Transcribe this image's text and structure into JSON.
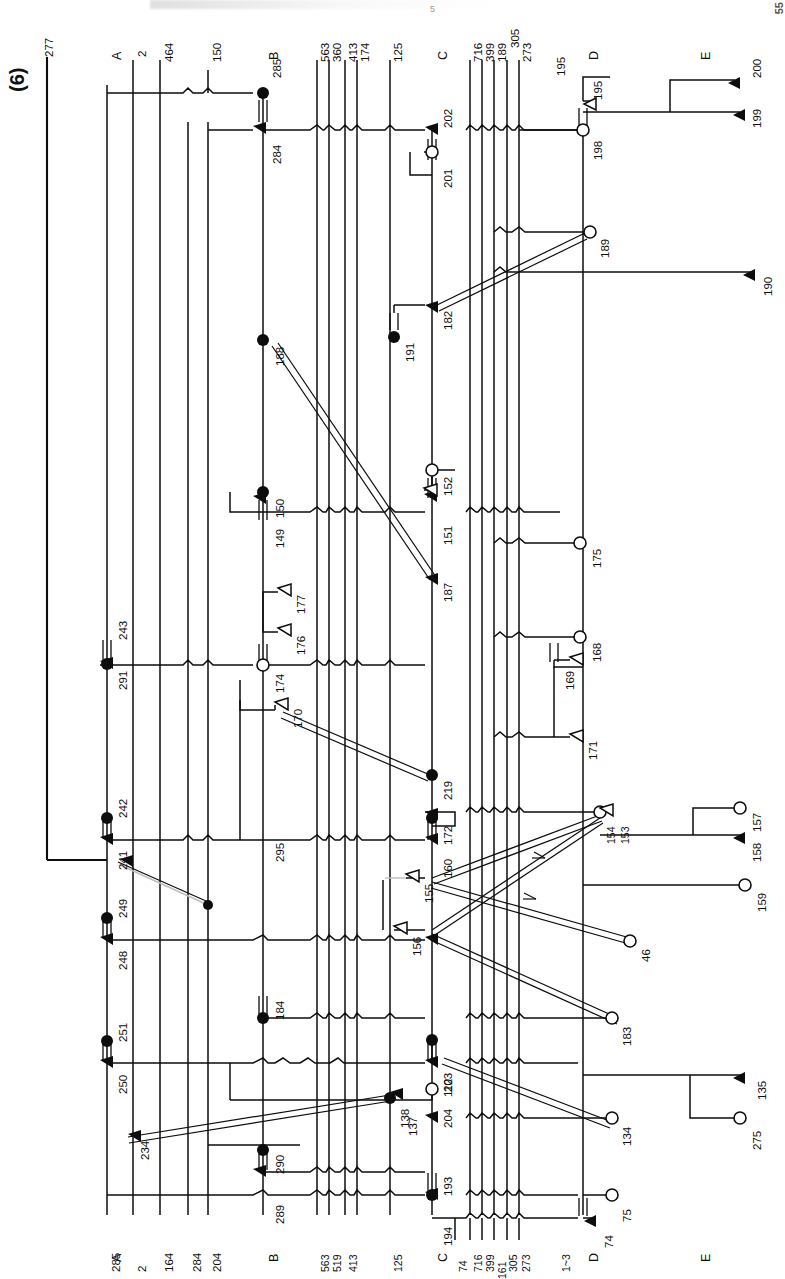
{
  "figure": {
    "number": "(6)",
    "page_number": "55",
    "header_ghost": "5"
  },
  "sections": [
    {
      "id": "A_top",
      "label": "A"
    },
    {
      "id": "B_top",
      "label": "B"
    },
    {
      "id": "C_top",
      "label": "C"
    },
    {
      "id": "D_top",
      "label": "D"
    },
    {
      "id": "E_top",
      "label": "E"
    },
    {
      "id": "A_bot",
      "label": "A"
    },
    {
      "id": "B_bot",
      "label": "B"
    },
    {
      "id": "C_bot",
      "label": "C"
    },
    {
      "id": "D_bot",
      "label": "D"
    },
    {
      "id": "E_bot",
      "label": "E"
    }
  ],
  "bus_labels_top": [
    {
      "id": "t277",
      "text": "277"
    },
    {
      "id": "t2",
      "text": "2"
    },
    {
      "id": "t464",
      "text": "464"
    },
    {
      "id": "t150",
      "text": "150"
    },
    {
      "id": "t563",
      "text": "563"
    },
    {
      "id": "t360",
      "text": "360"
    },
    {
      "id": "t413",
      "text": "413"
    },
    {
      "id": "t174",
      "text": "174"
    },
    {
      "id": "t125",
      "text": "125"
    },
    {
      "id": "t716",
      "text": "716"
    },
    {
      "id": "t399",
      "text": "399"
    },
    {
      "id": "t189",
      "text": "189"
    },
    {
      "id": "t305",
      "text": "305"
    },
    {
      "id": "t273",
      "text": "273"
    },
    {
      "id": "t195",
      "text": "195"
    }
  ],
  "bus_labels_bottom": [
    {
      "id": "b285",
      "text": "285"
    },
    {
      "id": "b2",
      "text": "2"
    },
    {
      "id": "b164",
      "text": "164"
    },
    {
      "id": "b284",
      "text": "284"
    },
    {
      "id": "b204",
      "text": "204"
    },
    {
      "id": "b563",
      "text": "563"
    },
    {
      "id": "b519",
      "text": "519"
    },
    {
      "id": "b413",
      "text": "413"
    },
    {
      "id": "b125",
      "text": "125"
    },
    {
      "id": "b74",
      "text": "74"
    },
    {
      "id": "b716",
      "text": "716"
    },
    {
      "id": "b399",
      "text": "399"
    },
    {
      "id": "b305",
      "text": "305"
    },
    {
      "id": "b273",
      "text": "273"
    },
    {
      "id": "b161",
      "text": "161"
    },
    {
      "id": "b1_3",
      "text": "1~3"
    }
  ],
  "terminals": [
    {
      "id": "n277",
      "text": "277",
      "kind": "line-end"
    },
    {
      "id": "n285",
      "text": "285",
      "kind": "solid"
    },
    {
      "id": "n284",
      "text": "284",
      "kind": "triangle"
    },
    {
      "id": "n202",
      "text": "202",
      "kind": "triangle"
    },
    {
      "id": "n201",
      "text": "201",
      "kind": "open"
    },
    {
      "id": "n195b",
      "text": "195",
      "kind": "triangle"
    },
    {
      "id": "n198",
      "text": "198",
      "kind": "open"
    },
    {
      "id": "n200",
      "text": "200",
      "kind": "triangle"
    },
    {
      "id": "n199",
      "text": "199",
      "kind": "triangle"
    },
    {
      "id": "n189",
      "text": "189",
      "kind": "open"
    },
    {
      "id": "n190",
      "text": "190",
      "kind": "triangle"
    },
    {
      "id": "n182",
      "text": "182",
      "kind": "triangle"
    },
    {
      "id": "n191",
      "text": "191",
      "kind": "solid"
    },
    {
      "id": "n188",
      "text": "188",
      "kind": "solid"
    },
    {
      "id": "n187",
      "text": "187",
      "kind": "triangle"
    },
    {
      "id": "n150",
      "text": "150",
      "kind": "solid"
    },
    {
      "id": "n149",
      "text": "149",
      "kind": "triangle"
    },
    {
      "id": "n152",
      "text": "152",
      "kind": "open"
    },
    {
      "id": "n151",
      "text": "151",
      "kind": "triangle"
    },
    {
      "id": "n175",
      "text": "175",
      "kind": "open"
    },
    {
      "id": "n177",
      "text": "177",
      "kind": "triangle"
    },
    {
      "id": "n176",
      "text": "176",
      "kind": "triangle"
    },
    {
      "id": "n174",
      "text": "174",
      "kind": "open"
    },
    {
      "id": "n170",
      "text": "170",
      "kind": "triangle"
    },
    {
      "id": "n168",
      "text": "168",
      "kind": "open"
    },
    {
      "id": "n169",
      "text": "169",
      "kind": "triangle"
    },
    {
      "id": "n171",
      "text": "171",
      "kind": "triangle"
    },
    {
      "id": "n243",
      "text": "243",
      "kind": "triangle"
    },
    {
      "id": "n291",
      "text": "291",
      "kind": "solid"
    },
    {
      "id": "n242",
      "text": "242",
      "kind": "solid"
    },
    {
      "id": "n241",
      "text": "241",
      "kind": "triangle"
    },
    {
      "id": "n295",
      "text": "295",
      "kind": "triangle"
    },
    {
      "id": "n219",
      "text": "219",
      "kind": "solid"
    },
    {
      "id": "n172",
      "text": "172",
      "kind": "solid"
    },
    {
      "id": "n160",
      "text": "160",
      "kind": "triangle"
    },
    {
      "id": "n153",
      "text": "153",
      "kind": "triangle"
    },
    {
      "id": "n154",
      "text": "154",
      "kind": "open"
    },
    {
      "id": "n157",
      "text": "157",
      "kind": "open"
    },
    {
      "id": "n158",
      "text": "158",
      "kind": "triangle"
    },
    {
      "id": "n159",
      "text": "159",
      "kind": "open"
    },
    {
      "id": "n155",
      "text": "155",
      "kind": "triangle"
    },
    {
      "id": "n156",
      "text": "156",
      "kind": "triangle"
    },
    {
      "id": "n46",
      "text": "46",
      "kind": "open"
    },
    {
      "id": "n249",
      "text": "249",
      "kind": "solid"
    },
    {
      "id": "n248",
      "text": "248",
      "kind": "triangle"
    },
    {
      "id": "n184",
      "text": "184",
      "kind": "solid"
    },
    {
      "id": "n183",
      "text": "183",
      "kind": "open"
    },
    {
      "id": "n251",
      "text": "251",
      "kind": "solid"
    },
    {
      "id": "n250",
      "text": "250",
      "kind": "triangle"
    },
    {
      "id": "n203",
      "text": "203",
      "kind": "triangle"
    },
    {
      "id": "n204",
      "text": "204",
      "kind": "open"
    },
    {
      "id": "n112",
      "text": "112",
      "kind": "triangle"
    },
    {
      "id": "n137",
      "text": "137",
      "kind": "triangle"
    },
    {
      "id": "n134",
      "text": "134",
      "kind": "open"
    },
    {
      "id": "n135",
      "text": "135",
      "kind": "triangle"
    },
    {
      "id": "n275",
      "text": "275",
      "kind": "open"
    },
    {
      "id": "n234",
      "text": "234",
      "kind": "triangle"
    },
    {
      "id": "n138",
      "text": "138",
      "kind": "solid"
    },
    {
      "id": "n290",
      "text": "290",
      "kind": "solid"
    },
    {
      "id": "n289",
      "text": "289",
      "kind": "triangle"
    },
    {
      "id": "n193",
      "text": "193",
      "kind": "triangle"
    },
    {
      "id": "n194",
      "text": "194",
      "kind": "solid"
    },
    {
      "id": "n75",
      "text": "75",
      "kind": "open"
    },
    {
      "id": "n74",
      "text": "74",
      "kind": "triangle"
    }
  ],
  "colors": {
    "ink": "#0d0d0d",
    "paper": "#ffffff",
    "faint": "#bdbdbd"
  }
}
